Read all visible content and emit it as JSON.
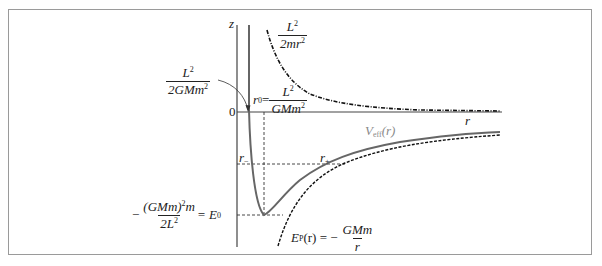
{
  "diagram": {
    "axes": {
      "vertical_label": "z",
      "horizontal_label": "r",
      "origin_label": "0"
    },
    "curves": [
      {
        "name": "centrifugal-term",
        "style": "dash-dot",
        "label_num": "L",
        "label_num_sup": "2",
        "label_den": "2mr",
        "label_den_sup": "2"
      },
      {
        "name": "effective-potential",
        "style": "solid",
        "label": "V",
        "label_sub": "eff",
        "label_arg": "(r)"
      },
      {
        "name": "gravitational-potential",
        "style": "dashed",
        "label_left": "E",
        "label_sub": "P",
        "label_mid": "(r) = −",
        "label_num": "GMm",
        "label_den": "r"
      }
    ],
    "annotations": {
      "zero_crossing": {
        "num": "L",
        "num_sup": "2",
        "den": "2GMm",
        "den_sup": "2"
      },
      "r0": {
        "left": "r",
        "left_sub": "0",
        "eq": " = ",
        "num": "L",
        "num_sup": "2",
        "den": "GMm",
        "den_sup": "2"
      },
      "r_minus": {
        "base": "r",
        "sub": "−"
      },
      "r_plus": {
        "base": "r",
        "sub": "+"
      },
      "E0": {
        "prefix": "−",
        "num": "(GMm)",
        "num_sup": "2",
        "num_tail": "m",
        "den": "2L",
        "den_sup": "2",
        "eq": " = E",
        "eq_sub": "0"
      }
    },
    "colors": {
      "axis": "#444444",
      "veff_curve": "#666666",
      "veff_label": "#8a8a8a",
      "dashed": "#222222",
      "frame": "#9a9a9a"
    }
  }
}
